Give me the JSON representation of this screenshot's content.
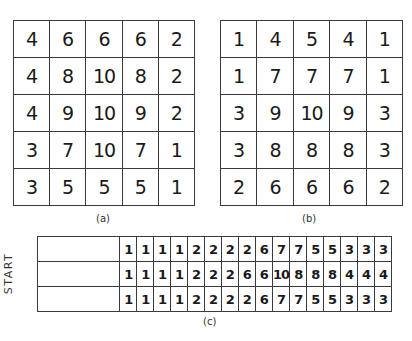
{
  "figure": {
    "panel_a": {
      "caption": "(a)",
      "rows": [
        [
          "4",
          "6",
          "6",
          "6",
          "2"
        ],
        [
          "4",
          "8",
          "10",
          "8",
          "2"
        ],
        [
          "4",
          "9",
          "10",
          "9",
          "2"
        ],
        [
          "3",
          "7",
          "10",
          "7",
          "1"
        ],
        [
          "3",
          "5",
          "5",
          "5",
          "1"
        ]
      ]
    },
    "panel_b": {
      "caption": "(b)",
      "rows": [
        [
          "1",
          "4",
          "5",
          "4",
          "1"
        ],
        [
          "1",
          "7",
          "7",
          "7",
          "1"
        ],
        [
          "3",
          "9",
          "10",
          "9",
          "3"
        ],
        [
          "3",
          "8",
          "8",
          "8",
          "3"
        ],
        [
          "2",
          "6",
          "6",
          "6",
          "2"
        ]
      ]
    },
    "panel_c": {
      "caption": "(c)",
      "side_label": "START",
      "rows": [
        [
          "1",
          "1",
          "1",
          "1",
          "2",
          "2",
          "2",
          "2",
          "6",
          "7",
          "7",
          "5",
          "5",
          "3",
          "3",
          "3"
        ],
        [
          "1",
          "1",
          "1",
          "1",
          "2",
          "2",
          "2",
          "6",
          "6",
          "10",
          "8",
          "8",
          "8",
          "4",
          "4",
          "4"
        ],
        [
          "1",
          "1",
          "1",
          "1",
          "2",
          "2",
          "2",
          "2",
          "6",
          "7",
          "7",
          "5",
          "5",
          "3",
          "3",
          "3"
        ]
      ]
    }
  }
}
